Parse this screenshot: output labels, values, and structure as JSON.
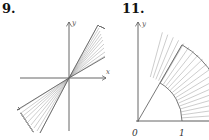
{
  "figures": [
    {
      "number": "9.",
      "x_axis_label": "x",
      "y_axis_label": "y",
      "description": "Two opposite wedges through the origin, shaded with rays (double cone region)"
    },
    {
      "number": "11.",
      "y_axis_label": "y",
      "origin_label": "0",
      "tick_label": "1",
      "description": "Annular sector between radius 1 and 2, from angle pi/3 to 0, shaded"
    }
  ],
  "colors": {
    "ink": "#333333",
    "hatch": "#9a9a9a",
    "background": "#ffffff"
  }
}
